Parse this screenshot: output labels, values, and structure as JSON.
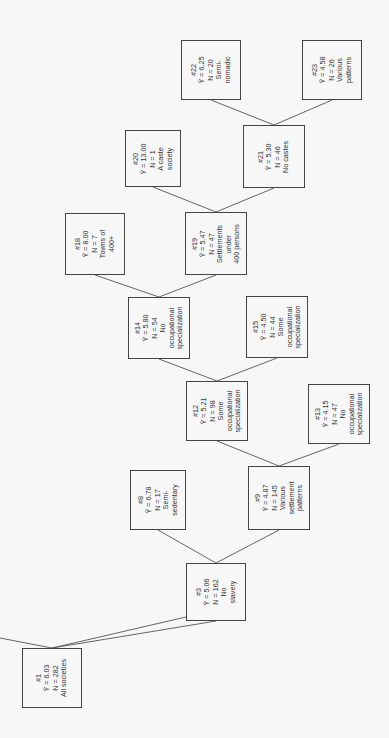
{
  "diagram": {
    "type": "regression-tree",
    "orientation": "rotated-90-ccw",
    "stat_symbol": "Ȳ",
    "nodes": [
      {
        "id": "1",
        "label": "#1",
        "mean": "Ȳ = 6.03",
        "n": "N = 282",
        "desc": [
          "All societies"
        ],
        "box": [
          22,
          648,
          60,
          60
        ]
      },
      {
        "id": "3",
        "label": "#3",
        "mean": "Ȳ = 5.06",
        "n": "N = 162",
        "desc": [
          "No",
          "slavery"
        ],
        "box": [
          186,
          563,
          60,
          58
        ]
      },
      {
        "id": "8",
        "label": "#8",
        "mean": "Ȳ = 6.78",
        "n": "N = 17",
        "desc": [
          "Semi-",
          "sedentary"
        ],
        "box": [
          130,
          470,
          56,
          60
        ]
      },
      {
        "id": "9",
        "label": "#9",
        "mean": "Ȳ = 4.87",
        "n": "N = 145",
        "desc": [
          "Various",
          "settlement",
          "patterns"
        ],
        "box": [
          248,
          466,
          62,
          64
        ]
      },
      {
        "id": "12",
        "label": "#12",
        "mean": "Ȳ = 5.21",
        "n": "N = 98",
        "desc": [
          "Some",
          "occupational",
          "specialization"
        ],
        "box": [
          186,
          381,
          62,
          60
        ]
      },
      {
        "id": "13",
        "label": "#13",
        "mean": "Ȳ = 4.15",
        "n": "N = 47",
        "desc": [
          "No",
          "occupational",
          "specialization"
        ],
        "box": [
          308,
          384,
          62,
          60
        ]
      },
      {
        "id": "14",
        "label": "#14",
        "mean": "Ȳ = 5.80",
        "n": "N = 54",
        "desc": [
          "No",
          "occupational",
          "specialization"
        ],
        "box": [
          128,
          297,
          62,
          62
        ]
      },
      {
        "id": "15",
        "label": "#15",
        "mean": "Ȳ = 4.50",
        "n": "N = 44",
        "desc": [
          "Some",
          "occupational",
          "specialization"
        ],
        "box": [
          246,
          296,
          62,
          62
        ]
      },
      {
        "id": "18",
        "label": "#18",
        "mean": "Ȳ = 8.00",
        "n": "N = 7",
        "desc": [
          "Towns of",
          "400+"
        ],
        "box": [
          65,
          213,
          60,
          62
        ]
      },
      {
        "id": "19",
        "label": "#19",
        "mean": "Ȳ = 5.47",
        "n": "N = 47",
        "desc": [
          "Settlements",
          "under",
          "400 persons"
        ],
        "box": [
          185,
          212,
          62,
          63
        ]
      },
      {
        "id": "20",
        "label": "#20",
        "mean": "Ȳ = 13.00",
        "n": "N = 1",
        "desc": [
          "A caste",
          "society"
        ],
        "box": [
          125,
          130,
          56,
          57
        ]
      },
      {
        "id": "21",
        "label": "#21",
        "mean": "Ȳ = 5.30",
        "n": "N = 46",
        "desc": [
          "No castes"
        ],
        "box": [
          243,
          125,
          62,
          63
        ]
      },
      {
        "id": "22",
        "label": "#22",
        "mean": "Ȳ = 6.25",
        "n": "N = 20",
        "desc": [
          "Semi-",
          "nomadic"
        ],
        "box": [
          181,
          40,
          60,
          60
        ]
      },
      {
        "id": "23",
        "label": "#23",
        "mean": "Ȳ = 4.58",
        "n": "N = 26",
        "desc": [
          "Various",
          "patterns"
        ],
        "box": [
          302,
          40,
          60,
          60
        ]
      }
    ],
    "edges": [
      [
        "1",
        "3"
      ],
      [
        "3",
        "8"
      ],
      [
        "3",
        "9"
      ],
      [
        "9",
        "12"
      ],
      [
        "9",
        "13"
      ],
      [
        "12",
        "14"
      ],
      [
        "12",
        "15"
      ],
      [
        "14",
        "18"
      ],
      [
        "14",
        "19"
      ],
      [
        "19",
        "20"
      ],
      [
        "19",
        "21"
      ],
      [
        "21",
        "22"
      ],
      [
        "21",
        "23"
      ]
    ],
    "offscreen_edge_from_1": true
  }
}
